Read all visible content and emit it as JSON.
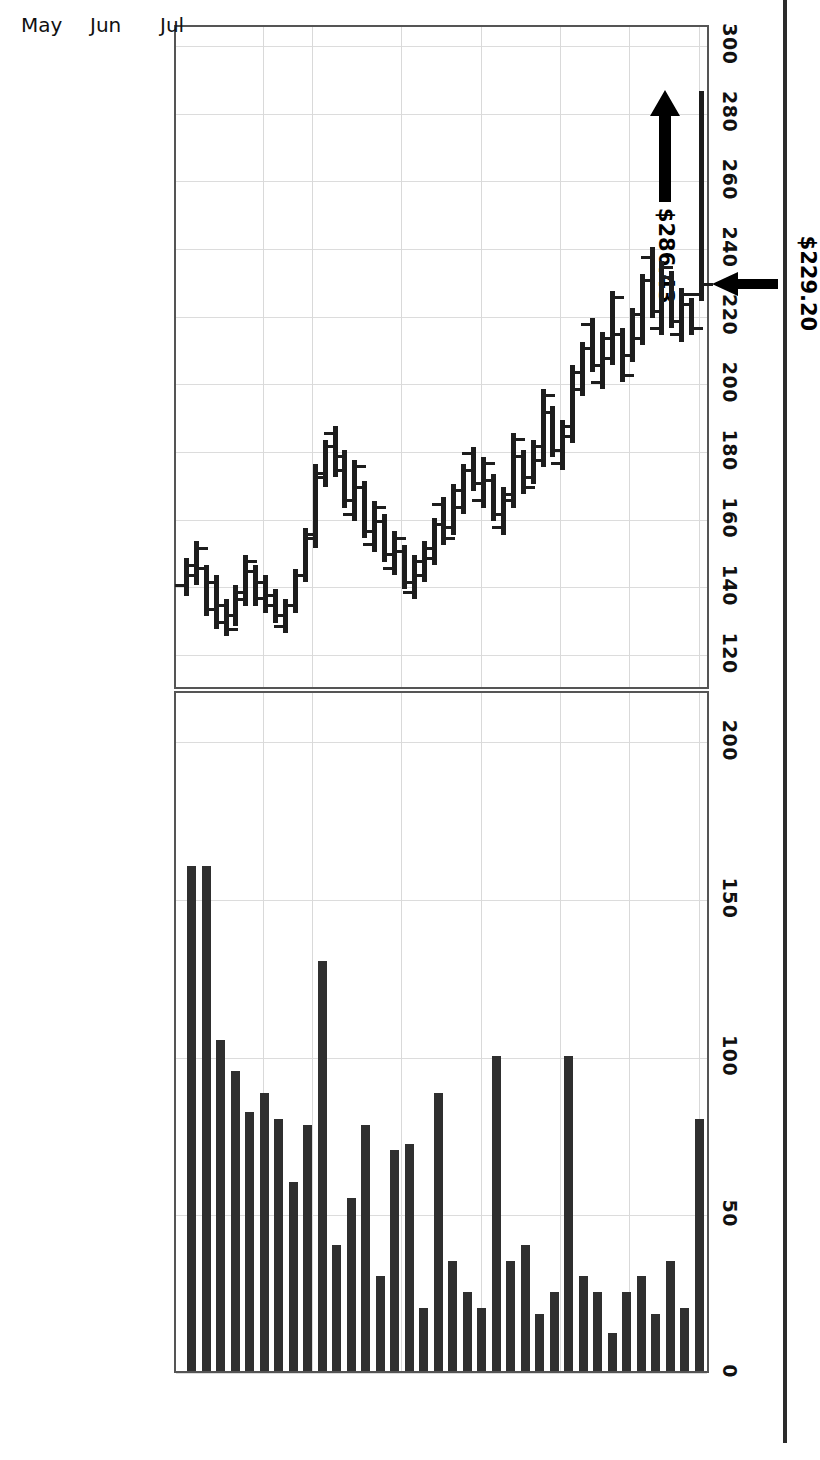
{
  "chart_data": {
    "type": "bar",
    "chart_kind": "stock-hlc-with-volume",
    "title": "",
    "subtitle": "",
    "xlabel": "",
    "ylabel": "",
    "orientation": "rotated-90-clockwise",
    "grid": true,
    "legend": "none",
    "price_axis": {
      "label": "",
      "ticks": [
        300,
        280,
        260,
        240,
        220,
        200,
        180,
        160,
        140,
        120
      ],
      "tick_labels": [
        "300",
        "280",
        "260",
        "240",
        "220",
        "200",
        "180",
        "160",
        "140",
        "120"
      ],
      "ylim": [
        110,
        305
      ]
    },
    "volume_axis": {
      "label": "",
      "ticks": [
        200,
        150,
        100,
        50,
        0
      ],
      "tick_labels": [
        "200",
        "150",
        "100",
        "50",
        "0"
      ],
      "ylim": [
        0,
        215
      ]
    },
    "x_tick_labels": [
      "21",
      "Feb",
      "Mar",
      "Apr",
      "May",
      "Jun",
      "Jul"
    ],
    "x_tick_positions": [
      8,
      13,
      22,
      30,
      38,
      45,
      52
    ],
    "annotations": [
      {
        "id": "high-annotation",
        "text": "$286.43",
        "marker": "arrow-up",
        "value": 286.43,
        "points_to": "last-bar-high"
      },
      {
        "id": "close-annotation",
        "text": "$229.20",
        "marker": "arrow-left",
        "value": 229.2,
        "points_to": "last-bar-close"
      }
    ],
    "series": [
      {
        "name": "Price (High-Low-Close)",
        "type": "hlc",
        "bars": [
          {
            "i": 0,
            "high": 148,
            "low": 137,
            "open": 140,
            "close": 146
          },
          {
            "i": 1,
            "high": 153,
            "low": 140,
            "open": 143,
            "close": 151
          },
          {
            "i": 2,
            "high": 146,
            "low": 131,
            "open": 145,
            "close": 133
          },
          {
            "i": 3,
            "high": 143,
            "low": 127,
            "open": 141,
            "close": 129
          },
          {
            "i": 4,
            "high": 136,
            "low": 125,
            "open": 134,
            "close": 127
          },
          {
            "i": 5,
            "high": 140,
            "low": 128,
            "open": 131,
            "close": 138
          },
          {
            "i": 6,
            "high": 149,
            "low": 134,
            "open": 136,
            "close": 147
          },
          {
            "i": 7,
            "high": 146,
            "low": 134,
            "open": 144,
            "close": 136
          },
          {
            "i": 8,
            "high": 143,
            "low": 132,
            "open": 141,
            "close": 134
          },
          {
            "i": 9,
            "high": 139,
            "low": 129,
            "open": 137,
            "close": 131
          },
          {
            "i": 10,
            "high": 136,
            "low": 126,
            "open": 128,
            "close": 134
          },
          {
            "i": 11,
            "high": 145,
            "low": 132,
            "open": 134,
            "close": 143
          },
          {
            "i": 12,
            "high": 157,
            "low": 141,
            "open": 143,
            "close": 155
          },
          {
            "i": 13,
            "high": 176,
            "low": 151,
            "open": 154,
            "close": 173
          },
          {
            "i": 14,
            "high": 183,
            "low": 169,
            "open": 172,
            "close": 181
          },
          {
            "i": 15,
            "high": 187,
            "low": 172,
            "open": 185,
            "close": 174
          },
          {
            "i": 16,
            "high": 180,
            "low": 163,
            "open": 178,
            "close": 165
          },
          {
            "i": 17,
            "high": 177,
            "low": 159,
            "open": 161,
            "close": 175
          },
          {
            "i": 18,
            "high": 171,
            "low": 154,
            "open": 169,
            "close": 156
          },
          {
            "i": 19,
            "high": 165,
            "low": 150,
            "open": 152,
            "close": 163
          },
          {
            "i": 20,
            "high": 161,
            "low": 147,
            "open": 159,
            "close": 149
          },
          {
            "i": 21,
            "high": 156,
            "low": 143,
            "open": 145,
            "close": 154
          },
          {
            "i": 22,
            "high": 152,
            "low": 139,
            "open": 150,
            "close": 141
          },
          {
            "i": 23,
            "high": 149,
            "low": 136,
            "open": 138,
            "close": 147
          },
          {
            "i": 24,
            "high": 153,
            "low": 141,
            "open": 143,
            "close": 151
          },
          {
            "i": 25,
            "high": 160,
            "low": 146,
            "open": 148,
            "close": 158
          },
          {
            "i": 26,
            "high": 166,
            "low": 152,
            "open": 164,
            "close": 154
          },
          {
            "i": 27,
            "high": 170,
            "low": 155,
            "open": 157,
            "close": 168
          },
          {
            "i": 28,
            "high": 176,
            "low": 161,
            "open": 163,
            "close": 174
          },
          {
            "i": 29,
            "high": 181,
            "low": 168,
            "open": 179,
            "close": 170
          },
          {
            "i": 30,
            "high": 178,
            "low": 163,
            "open": 165,
            "close": 176
          },
          {
            "i": 31,
            "high": 173,
            "low": 159,
            "open": 171,
            "close": 161
          },
          {
            "i": 32,
            "high": 169,
            "low": 155,
            "open": 157,
            "close": 167
          },
          {
            "i": 33,
            "high": 185,
            "low": 163,
            "open": 165,
            "close": 183
          },
          {
            "i": 34,
            "high": 180,
            "low": 167,
            "open": 178,
            "close": 169
          },
          {
            "i": 35,
            "high": 183,
            "low": 170,
            "open": 172,
            "close": 181
          },
          {
            "i": 36,
            "high": 198,
            "low": 175,
            "open": 177,
            "close": 196
          },
          {
            "i": 37,
            "high": 193,
            "low": 178,
            "open": 191,
            "close": 180
          },
          {
            "i": 38,
            "high": 189,
            "low": 174,
            "open": 176,
            "close": 187
          },
          {
            "i": 39,
            "high": 205,
            "low": 182,
            "open": 184,
            "close": 203
          },
          {
            "i": 40,
            "high": 212,
            "low": 196,
            "open": 198,
            "close": 210
          },
          {
            "i": 41,
            "high": 219,
            "low": 203,
            "open": 217,
            "close": 205
          },
          {
            "i": 42,
            "high": 215,
            "low": 198,
            "open": 200,
            "close": 213
          },
          {
            "i": 43,
            "high": 227,
            "low": 205,
            "open": 207,
            "close": 225
          },
          {
            "i": 44,
            "high": 216,
            "low": 200,
            "open": 214,
            "close": 202
          },
          {
            "i": 45,
            "high": 222,
            "low": 206,
            "open": 208,
            "close": 220
          },
          {
            "i": 46,
            "high": 232,
            "low": 211,
            "open": 213,
            "close": 230
          },
          {
            "i": 47,
            "high": 240,
            "low": 219,
            "open": 237,
            "close": 221
          },
          {
            "i": 48,
            "high": 236,
            "low": 214,
            "open": 216,
            "close": 234
          },
          {
            "i": 49,
            "high": 233,
            "low": 216,
            "open": 231,
            "close": 218
          },
          {
            "i": 50,
            "high": 228,
            "low": 212,
            "open": 214,
            "close": 226
          },
          {
            "i": 51,
            "high": 225,
            "low": 214,
            "open": 223,
            "close": 216
          },
          {
            "i": 52,
            "high": 286,
            "low": 224,
            "open": 226,
            "close": 229
          }
        ]
      },
      {
        "name": "Volume",
        "type": "bar",
        "values": [
          160,
          160,
          105,
          95,
          82,
          88,
          80,
          60,
          78,
          130,
          40,
          55,
          78,
          30,
          70,
          72,
          20,
          88,
          35,
          25,
          20,
          100,
          35,
          40,
          18,
          25,
          100,
          30,
          25,
          12,
          25,
          30,
          18,
          35,
          20,
          80
        ]
      }
    ]
  }
}
